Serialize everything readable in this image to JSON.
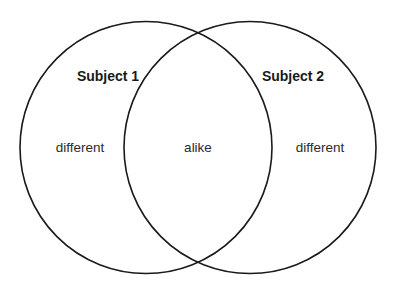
{
  "diagram": {
    "type": "venn",
    "stroke_color": "#1a1a1a",
    "background_color": "#ffffff",
    "circles": [
      {
        "id": "subject-1",
        "cx": 146,
        "cy": 147.5,
        "r": 126
      },
      {
        "id": "subject-2",
        "cx": 250,
        "cy": 147.5,
        "r": 126
      }
    ],
    "labels": {
      "subject1_title": "Subject 1",
      "subject2_title": "Subject 2",
      "left_region": "different",
      "overlap_region": "alike",
      "right_region": "different"
    }
  }
}
